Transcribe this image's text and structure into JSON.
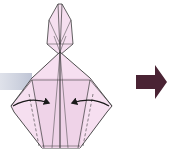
{
  "diagram": {
    "title": "Origami fold step",
    "colors": {
      "paper": "#f6dff0",
      "paper_dark": "#ecc8e2",
      "line": "#3a3a3a",
      "step_arrow": "#4a2334",
      "gray_bar": "#c9cedc"
    },
    "elements": {
      "model": "Origami rabbit base, front view",
      "fold_arrows": [
        "fold-left-flap-to-center",
        "fold-right-flap-to-center"
      ],
      "valley_fold_lines": 2,
      "next_step_arrow": "right"
    },
    "caption": ""
  }
}
